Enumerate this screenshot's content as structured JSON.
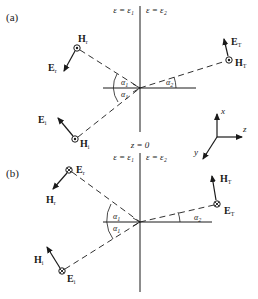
{
  "figure": {
    "panel_a": {
      "label": "(a)",
      "media": {
        "left": "ε = ε₁",
        "right": "ε = ε₂"
      },
      "vectors": {
        "incident": {
          "field_dot": "H",
          "field_dot_sub": "i",
          "field_arrow": "E",
          "field_arrow_sub": "i"
        },
        "reflected": {
          "field_dot": "H",
          "field_dot_sub": "r",
          "field_arrow": "E",
          "field_arrow_sub": "r"
        },
        "transmitted": {
          "field_dot": "H",
          "field_dot_sub": "T",
          "field_arrow": "E",
          "field_arrow_sub": "T"
        }
      },
      "angles": {
        "incident": "α",
        "incident_sub": "1",
        "reflected": "α",
        "reflected_sub": "1",
        "transmitted": "α",
        "transmitted_sub": "2"
      }
    },
    "interface_label": "z = 0",
    "panel_b": {
      "label": "(b)",
      "media": {
        "left": "ε = ε₁",
        "right": "ε = ε₂"
      },
      "vectors": {
        "incident": {
          "field_dot": "E",
          "field_dot_sub": "i",
          "field_arrow": "H",
          "field_arrow_sub": "i"
        },
        "reflected": {
          "field_dot": "E",
          "field_dot_sub": "r",
          "field_arrow": "H",
          "field_arrow_sub": "r"
        },
        "transmitted": {
          "field_dot": "E",
          "field_dot_sub": "T",
          "field_arrow": "H",
          "field_arrow_sub": "T"
        }
      },
      "angles": {
        "incident": "α",
        "incident_sub": "1",
        "reflected": "α",
        "reflected_sub": "1",
        "transmitted": "α",
        "transmitted_sub": "2"
      }
    },
    "axes": {
      "x": "x",
      "y": "y",
      "z": "z"
    },
    "colors": {
      "ink": "#1a1a1a",
      "background": "#ffffff"
    }
  }
}
